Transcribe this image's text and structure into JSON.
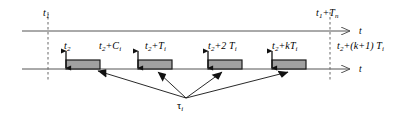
{
  "figure": {
    "type": "timing-diagram",
    "background_color": "#ffffff",
    "line_color": "#555555",
    "bar_fill_color": "#a0a0a0",
    "bar_border_color": "#1a1a1a",
    "dashed_color": "#666666"
  },
  "axes": {
    "top": {
      "name": "t",
      "y": 31,
      "x_start": 22,
      "x_end": 356
    },
    "bottom": {
      "name": "t",
      "y": 69,
      "x_start": 22,
      "x_end": 356
    }
  },
  "dashed_lines": [
    {
      "name": "t1-marker",
      "x": 48
    },
    {
      "name": "period-end-marker",
      "x": 330
    }
  ],
  "top_labels": [
    {
      "id": "t1",
      "text": "t",
      "sub": "1",
      "x": 43,
      "y": 8
    },
    {
      "id": "t1-plus-Tn",
      "text": "t",
      "sub": "1",
      "suffix": "+T",
      "suffix_sub": "n",
      "x": 316,
      "y": 8
    }
  ],
  "bottom_labels": [
    {
      "id": "t2",
      "x": 64,
      "y": 41,
      "parts": [
        {
          "t": "t",
          "s": "2"
        }
      ]
    },
    {
      "id": "t2-plus-Ci",
      "x": 99,
      "y": 41,
      "parts": [
        {
          "t": "t",
          "s": "2"
        },
        {
          "t": "+C",
          "s": "i"
        }
      ]
    },
    {
      "id": "t2-plus-Ti",
      "x": 145,
      "y": 41,
      "parts": [
        {
          "t": "t",
          "s": "2"
        },
        {
          "t": "+T",
          "s": "i"
        }
      ]
    },
    {
      "id": "t2-plus-2Ti",
      "x": 208,
      "y": 41,
      "parts": [
        {
          "t": "t",
          "s": "2"
        },
        {
          "t": "+2 T",
          "s": "i"
        }
      ]
    },
    {
      "id": "t2-plus-kTi",
      "x": 272,
      "y": 41,
      "parts": [
        {
          "t": "t",
          "s": "2"
        },
        {
          "t": "+kT",
          "s": "i"
        }
      ]
    },
    {
      "id": "t2-plus-k1Ti",
      "x": 337,
      "y": 41,
      "parts": [
        {
          "t": "t",
          "s": "2"
        },
        {
          "t": "+(k+1) T",
          "s": "i"
        }
      ]
    }
  ],
  "bars": [
    {
      "id": "job-1",
      "x": 66,
      "width": 34,
      "y": 60,
      "height": 9
    },
    {
      "id": "job-2",
      "x": 138,
      "width": 34,
      "y": 60,
      "height": 9
    },
    {
      "id": "job-3",
      "x": 208,
      "width": 34,
      "y": 60,
      "height": 9
    },
    {
      "id": "job-4",
      "x": 272,
      "width": 34,
      "y": 60,
      "height": 9
    }
  ],
  "release_arrows": [
    {
      "id": "release-1",
      "x": 66,
      "y_top": 50,
      "y_bottom": 69
    },
    {
      "id": "release-2",
      "x": 138,
      "y_top": 50,
      "y_bottom": 69
    },
    {
      "id": "release-3",
      "x": 208,
      "y_top": 50,
      "y_bottom": 69
    },
    {
      "id": "release-4",
      "x": 272,
      "y_top": 50,
      "y_bottom": 69
    }
  ],
  "tau": {
    "label": "τ",
    "subscript": "i",
    "x": 177,
    "y": 101,
    "origin_x": 186,
    "origin_y": 98,
    "leaders": [
      {
        "id": "leader-1",
        "x2": 98,
        "y2": 71
      },
      {
        "id": "leader-2",
        "x2": 158,
        "y2": 72
      },
      {
        "id": "leader-3",
        "x2": 222,
        "y2": 72
      },
      {
        "id": "leader-4",
        "x2": 288,
        "y2": 72
      }
    ]
  }
}
